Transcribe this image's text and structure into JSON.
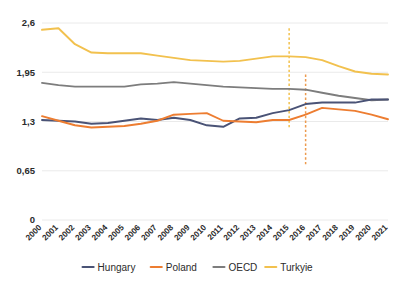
{
  "chart_data": {
    "type": "line",
    "title": "",
    "xlabel": "",
    "ylabel": "",
    "ylim": [
      0,
      2.6
    ],
    "yticks": [
      0,
      0.65,
      1.3,
      1.95,
      2.6
    ],
    "ytick_labels": [
      "0",
      "0,65",
      "1,3",
      "1,95",
      "2,6"
    ],
    "grid": true,
    "legend_position": "bottom",
    "categories": [
      "2000",
      "2001",
      "2002",
      "2003",
      "2004",
      "2005",
      "2006",
      "2007",
      "2008",
      "2009",
      "2010",
      "2011",
      "2012",
      "2013",
      "2014",
      "2015",
      "2016",
      "2017",
      "2018",
      "2019",
      "2020",
      "2021"
    ],
    "series": [
      {
        "name": "Hungary",
        "color": "#4a5376",
        "values": [
          1.32,
          1.31,
          1.3,
          1.27,
          1.28,
          1.31,
          1.34,
          1.32,
          1.35,
          1.32,
          1.25,
          1.23,
          1.34,
          1.35,
          1.41,
          1.45,
          1.53,
          1.55,
          1.55,
          1.55,
          1.59,
          1.59
        ]
      },
      {
        "name": "Poland",
        "color": "#ed7d31",
        "values": [
          1.37,
          1.31,
          1.25,
          1.22,
          1.23,
          1.24,
          1.27,
          1.31,
          1.39,
          1.4,
          1.41,
          1.31,
          1.3,
          1.29,
          1.32,
          1.32,
          1.39,
          1.48,
          1.46,
          1.44,
          1.39,
          1.33
        ]
      },
      {
        "name": "OECD",
        "color": "#7d7d7d",
        "values": [
          1.81,
          1.78,
          1.76,
          1.76,
          1.76,
          1.76,
          1.79,
          1.8,
          1.82,
          1.8,
          1.78,
          1.76,
          1.75,
          1.74,
          1.73,
          1.73,
          1.72,
          1.68,
          1.64,
          1.61,
          1.58,
          1.59
        ]
      },
      {
        "name": "Turkyie",
        "color": "#f2c14e",
        "values": [
          2.51,
          2.53,
          2.32,
          2.21,
          2.2,
          2.2,
          2.2,
          2.17,
          2.14,
          2.11,
          2.1,
          2.09,
          2.1,
          2.13,
          2.16,
          2.16,
          2.15,
          2.11,
          2.03,
          1.96,
          1.93,
          1.92
        ]
      }
    ],
    "markers": [
      {
        "name": "marker-2015",
        "x_category": "2015",
        "color": "#f2c14e",
        "style": "dashed",
        "y_top": 2.53,
        "y_bottom": 1.22
      },
      {
        "name": "marker-2016",
        "x_category": "2016",
        "color": "#ed9a4e",
        "style": "dashed",
        "y_top": 1.92,
        "y_bottom": 0.71
      }
    ]
  },
  "legend": {
    "items": [
      {
        "label": "Hungary",
        "color": "#4a5376"
      },
      {
        "label": "Poland",
        "color": "#ed7d31"
      },
      {
        "label": "OECD",
        "color": "#7d7d7d"
      },
      {
        "label": "Turkyie",
        "color": "#f2c14e"
      }
    ]
  }
}
